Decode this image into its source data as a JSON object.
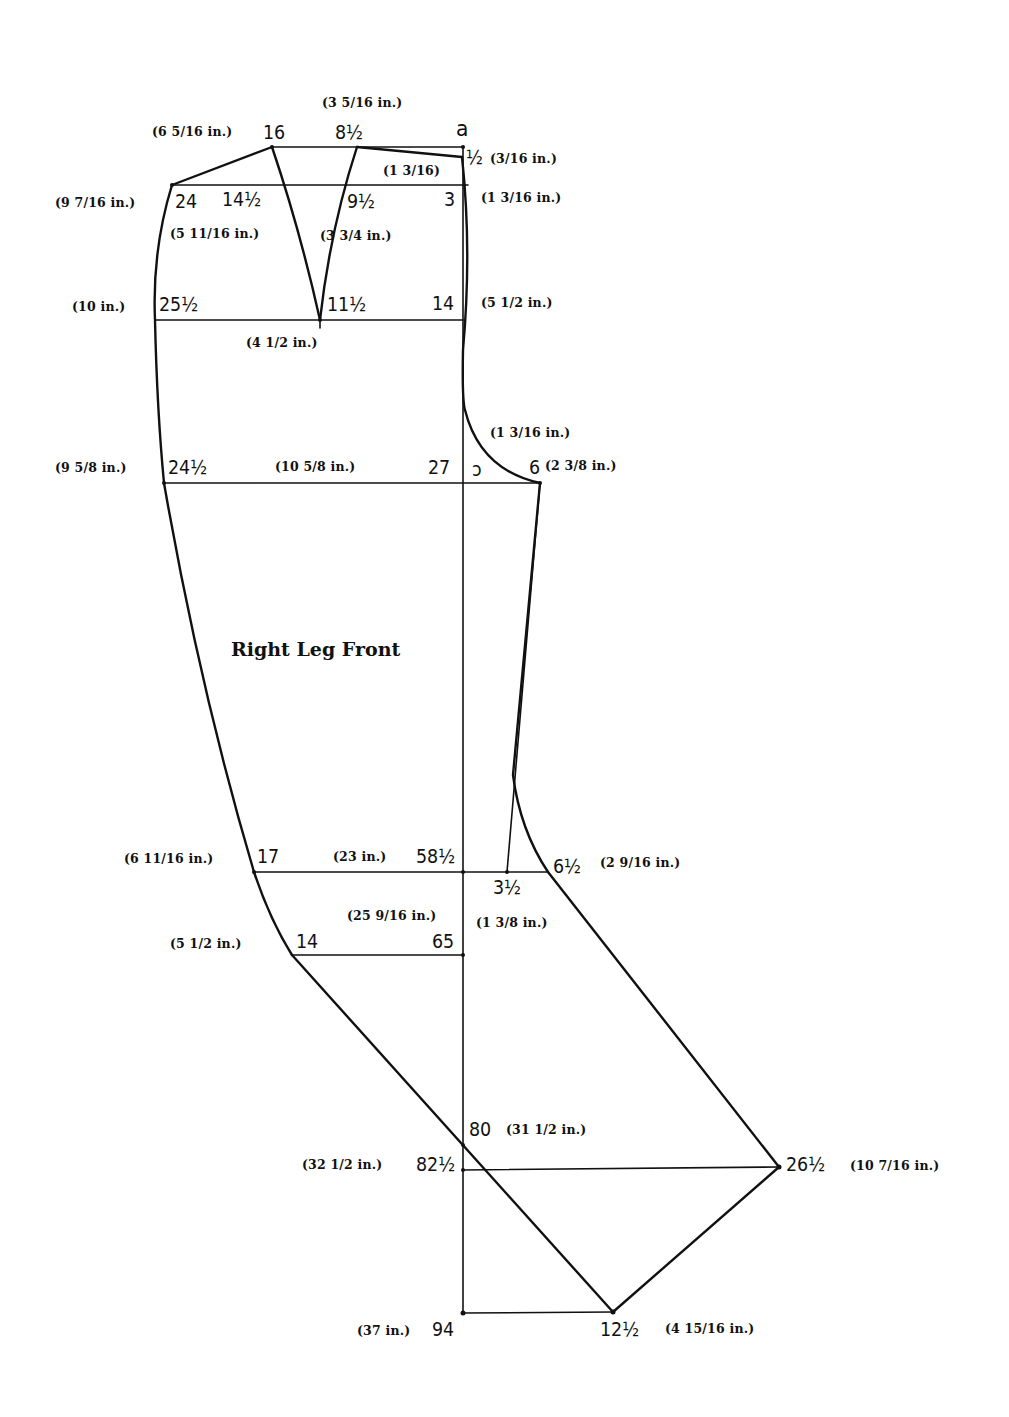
{
  "diagram": {
    "title": "Right Leg Front",
    "stroke_color": "#111111",
    "background": "#ffffff",
    "points": {
      "a": {
        "label": "a",
        "x": 463,
        "y": 147
      },
      "p16": {
        "label": "16",
        "measure": "(6 5/16 in.)",
        "x": 272,
        "y": 147
      },
      "p8_5": {
        "label": "8½",
        "measure": "(3 5/16 in.)",
        "x": 357,
        "y": 147
      },
      "p0_5": {
        "label": "½",
        "measure": "(3/16 in.)",
        "x": 462,
        "y": 157
      },
      "p1_3_16": {
        "measure": "(1 3/16)"
      },
      "p24": {
        "label": "24",
        "measure": "(9 7/16 in.)",
        "x": 172,
        "y": 185
      },
      "p14_5": {
        "label": "14½",
        "measure": "(5 11/16 in.)",
        "x": 288,
        "y": 185
      },
      "p9_5": {
        "label": "9½",
        "measure": "(3 3/4 in.)",
        "x": 344,
        "y": 185
      },
      "p3": {
        "label": "3",
        "measure": "(1 3/16 in.)",
        "x": 463,
        "y": 185
      },
      "p25_5": {
        "label": "25½",
        "measure": "(10 in.)",
        "x": 155,
        "y": 320
      },
      "p11_5": {
        "label": "11½",
        "measure": "(4 1/2 in.)",
        "x": 320,
        "y": 320
      },
      "p14a": {
        "label": "14",
        "measure": "(5 1/2 in.)",
        "x": 463,
        "y": 320
      },
      "p24_5": {
        "label": "24½",
        "measure": "(9 5/8 in.)",
        "x": 164,
        "y": 483
      },
      "p27": {
        "label": "27",
        "measure": "(10 5/8 in.)",
        "x": 463,
        "y": 483
      },
      "p_curve": {
        "label": "ↄ",
        "measure": "(1 3/16 in.)"
      },
      "p6": {
        "label": "6",
        "measure": "(2 3/8 in.)",
        "x": 540,
        "y": 483
      },
      "p17": {
        "label": "17",
        "measure": "(6 11/16 in.)",
        "x": 254,
        "y": 872
      },
      "p58_5": {
        "label": "58½",
        "measure": "(23 in.)",
        "x": 463,
        "y": 872
      },
      "p3_5": {
        "label": "3½",
        "measure": "(1 3/8 in.)",
        "x": 507,
        "y": 872
      },
      "p6_5": {
        "label": "6½",
        "measure": "(2 9/16 in.)",
        "x": 548,
        "y": 872
      },
      "p14b": {
        "label": "14",
        "measure": "(5 1/2 in.)",
        "x": 292,
        "y": 955
      },
      "p65": {
        "label": "65",
        "measure": "(25 9/16 in.)",
        "x": 463,
        "y": 955
      },
      "p80": {
        "label": "80",
        "measure": "(31 1/2 in.)",
        "x": 463,
        "y": 1145
      },
      "p82_5": {
        "label": "82½",
        "measure": "(32 1/2 in.)",
        "x": 463,
        "y": 1170
      },
      "p26_5": {
        "label": "26½",
        "measure": "(10 7/16 in.)",
        "x": 779,
        "y": 1167
      },
      "p94": {
        "label": "94",
        "measure": "(37 in.)",
        "x": 463,
        "y": 1313
      },
      "p12_5": {
        "label": "12½",
        "measure": "(4 15/16 in.)",
        "x": 613,
        "y": 1312
      }
    }
  }
}
